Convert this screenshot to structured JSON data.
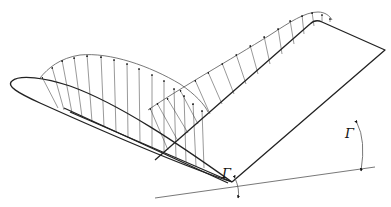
{
  "figure": {
    "colors": {
      "line": "#222222",
      "arrow": "#111111",
      "background": "#ffffff"
    },
    "labels": {
      "gamma_left": "Γ",
      "gamma_right": "Γ"
    },
    "vertex": [
      232,
      182
    ],
    "left_wing": {
      "airfoil_outline": "M 232 182 C 180 165, 100 130, 40 103 C 18 93, 6 86, 12 81 C 20 74, 45 78, 70 86 C 120 104, 180 145, 232 182",
      "upper_edge": "M 64 108 L 228 183",
      "lower_edge": "M 70 112 L 232 182",
      "camber_line": "M 40 103 C 70 110, 110 118, 232 182"
    },
    "right_wing": {
      "outline": "M 232 182 L 385 50 L 322 22 C 318 20, 314 20, 310 24 L 155 160"
    },
    "ground_line": [
      [
        155,
        198
      ],
      [
        375,
        167
      ]
    ],
    "left_lift": {
      "envelope": "M 40 78 C 48 68, 60 58, 80 55 C 110 52, 150 66, 180 84 C 195 94, 205 105, 208 112",
      "arrows": [
        [
          [
            58,
            108
          ],
          [
            42,
            77
          ]
        ],
        [
          [
            64,
            110
          ],
          [
            52,
            67
          ]
        ],
        [
          [
            72,
            113
          ],
          [
            62,
            60
          ]
        ],
        [
          [
            82,
            117
          ],
          [
            74,
            57
          ]
        ],
        [
          [
            92,
            122
          ],
          [
            87,
            55
          ]
        ],
        [
          [
            104,
            127
          ],
          [
            101,
            56
          ]
        ],
        [
          [
            116,
            132
          ],
          [
            114,
            59
          ]
        ],
        [
          [
            128,
            137
          ],
          [
            127,
            63
          ]
        ],
        [
          [
            140,
            143
          ],
          [
            139,
            68
          ]
        ],
        [
          [
            152,
            148
          ],
          [
            152,
            74
          ]
        ],
        [
          [
            164,
            153
          ],
          [
            164,
            80
          ]
        ],
        [
          [
            176,
            158
          ],
          [
            174,
            88
          ]
        ],
        [
          [
            186,
            162
          ],
          [
            184,
            95
          ]
        ],
        [
          [
            196,
            166
          ],
          [
            193,
            103
          ]
        ],
        [
          [
            204,
            168
          ],
          [
            202,
            110
          ]
        ]
      ]
    },
    "right_lift": {
      "envelope": "M 148 110 C 180 88, 230 60, 270 35 C 290 22, 305 12, 318 12 C 325 12, 330 16, 332 20",
      "arrows": [
        [
          [
            168,
            150
          ],
          [
            150,
            108
          ]
        ],
        [
          [
            178,
            141
          ],
          [
            157,
            103
          ]
        ],
        [
          [
            188,
            133
          ],
          [
            167,
            98
          ]
        ],
        [
          [
            198,
            124
          ],
          [
            180,
            90
          ]
        ],
        [
          [
            210,
            114
          ],
          [
            195,
            80
          ]
        ],
        [
          [
            222,
            104
          ],
          [
            208,
            72
          ]
        ],
        [
          [
            234,
            94
          ],
          [
            222,
            63
          ]
        ],
        [
          [
            246,
            84
          ],
          [
            236,
            54
          ]
        ],
        [
          [
            258,
            74
          ],
          [
            250,
            45
          ]
        ],
        [
          [
            270,
            64
          ],
          [
            264,
            36
          ]
        ],
        [
          [
            282,
            54
          ],
          [
            278,
            28
          ]
        ],
        [
          [
            294,
            44
          ],
          [
            290,
            20
          ]
        ],
        [
          [
            304,
            34
          ],
          [
            302,
            15
          ]
        ],
        [
          [
            314,
            26
          ],
          [
            312,
            12
          ]
        ],
        [
          [
            322,
            22
          ],
          [
            322,
            14
          ]
        ],
        [
          [
            330,
            22
          ],
          [
            330,
            18
          ]
        ]
      ]
    },
    "angles": {
      "left_arc": "M 235 178 Q 240 190 238 198",
      "right_arc": "M 357 123 Q 366 140 361 171",
      "left_arrow_tip": [
        [
          248,
          180
        ],
        [
          244,
          195
        ]
      ],
      "gamma_left_pos": [
        222,
        178
      ],
      "gamma_right_pos": [
        345,
        138
      ]
    }
  }
}
